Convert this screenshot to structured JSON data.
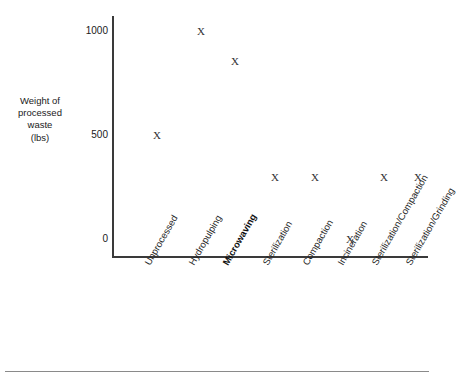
{
  "chart_data": {
    "type": "scatter",
    "title": "",
    "xlabel": "",
    "ylabel": "Weight of processed waste (lbs)",
    "ylabel_lines": [
      "Weight of",
      "processed",
      "waste",
      "(lbs)"
    ],
    "categories": [
      "Unprocessed",
      "Hydropulping",
      "Microwaving",
      "Sterilization",
      "Compaction",
      "Incineration",
      "Sterilization/Compaction",
      "Sterilization/Grinding"
    ],
    "values": [
      500,
      1000,
      855,
      300,
      300,
      0,
      300,
      300
    ],
    "ylim": [
      0,
      1000
    ],
    "yticks": [
      0,
      500,
      1000
    ],
    "ytick_labels": [
      "0",
      "500",
      "1000"
    ],
    "grid": false,
    "legend": false,
    "marker": "X",
    "points": [
      {
        "category": "Unprocessed",
        "value": 500,
        "marker": "X"
      },
      {
        "category": "Hydropulping",
        "value": 1000,
        "marker": "X"
      },
      {
        "category": "Microwaving",
        "value": 855,
        "marker": "X"
      },
      {
        "category": "Sterilization",
        "value": 300,
        "marker": "X"
      },
      {
        "category": "Compaction",
        "value": 300,
        "marker": "X"
      },
      {
        "category": "Incineration",
        "value": 0,
        "marker": "X"
      },
      {
        "category": "Sterilization/Compaction",
        "value": 300,
        "marker": "X"
      },
      {
        "category": "Sterilization/Grinding",
        "value": 300,
        "marker": "X"
      }
    ],
    "emphasized_categories": [
      "Microwaving"
    ]
  },
  "colors": {
    "background": "#ffffff",
    "axis": "#3a3a3a",
    "text": "#1a1a1a",
    "marker": "#333333",
    "rule": "#8a8a8a"
  }
}
